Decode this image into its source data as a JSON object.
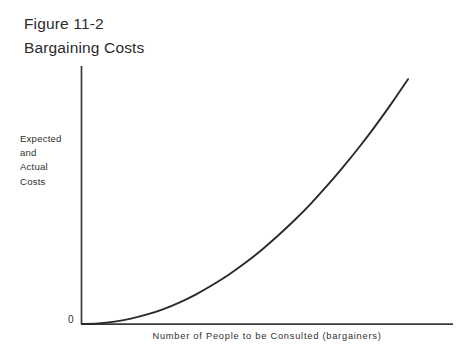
{
  "figure": {
    "title_line_1": "Figure 11-2",
    "title_line_2": "Bargaining Costs",
    "origin_label": "0"
  },
  "axes": {
    "y_label_lines": [
      "Expected",
      "and",
      "Actual",
      "Costs"
    ],
    "y_label_full": "Expected and Actual Costs",
    "x_label": "Number of People to be Consulted (bargainers)"
  },
  "colors": {
    "background": "#ffffff",
    "ink": "#2b2b2b",
    "axis": "#3a3a3a",
    "curve": "#2a2a2a"
  },
  "chart_data": {
    "type": "line",
    "title": "Figure 11-2 Bargaining Costs",
    "xlabel": "Number of People to be Consulted (bargainers)",
    "ylabel": "Expected and Actual Costs",
    "grid": false,
    "legend": null,
    "xlim": [
      0,
      1
    ],
    "ylim": [
      0,
      1
    ],
    "axis_ticks": {
      "x": [],
      "y": [],
      "origin": "0"
    },
    "annotations": [],
    "series": [
      {
        "name": "Expected and Actual Costs",
        "shape": "increasing convex (quadratic / exponential growth)",
        "x": [
          0.0,
          0.05,
          0.1,
          0.15,
          0.2,
          0.25,
          0.3,
          0.35,
          0.4,
          0.45,
          0.5,
          0.55,
          0.6,
          0.65,
          0.7,
          0.75,
          0.8,
          0.85,
          0.9,
          0.95,
          1.0
        ],
        "y": [
          0.0,
          0.002,
          0.009,
          0.021,
          0.037,
          0.058,
          0.084,
          0.115,
          0.151,
          0.191,
          0.236,
          0.286,
          0.341,
          0.4,
          0.464,
          0.533,
          0.607,
          0.685,
          0.768,
          0.856,
          0.949
        ]
      }
    ]
  }
}
